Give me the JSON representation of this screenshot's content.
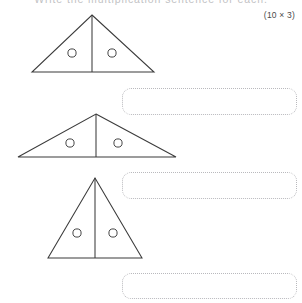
{
  "page": {
    "width": 302,
    "height": 303,
    "background": "#ffffff",
    "title": "Write the multiplication sentence for each.",
    "marks": "(10 × 3)"
  },
  "ink_color": "#3b3b3b",
  "box_border_color": "#b9b9bd",
  "questions": [
    {
      "number": "1",
      "figure": {
        "shape": "triangle",
        "orientation": "wide-isoceles",
        "divided_by": "vertical-median",
        "parts": 2,
        "dots_per_part": 1,
        "total_dots": 2
      },
      "answer_box": {
        "value": "",
        "placeholder": ""
      }
    },
    {
      "number": "2",
      "figure": {
        "shape": "triangle",
        "orientation": "flat-wide-isoceles",
        "divided_by": "vertical-median",
        "parts": 2,
        "dots_per_part": 1,
        "total_dots": 2
      },
      "answer_box": {
        "value": "",
        "placeholder": ""
      }
    },
    {
      "number": "3",
      "figure": {
        "shape": "triangle",
        "orientation": "tall-narrow-isoceles",
        "divided_by": "vertical-median",
        "parts": 2,
        "dots_per_part": 1,
        "total_dots": 2
      },
      "answer_box": {
        "value": "",
        "placeholder": ""
      }
    }
  ]
}
